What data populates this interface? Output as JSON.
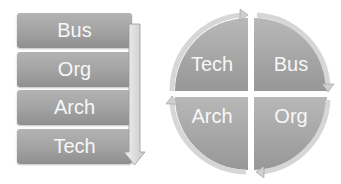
{
  "left_diagram": {
    "type": "vertical-process-stack",
    "items": [
      {
        "label": "Bus"
      },
      {
        "label": "Org"
      },
      {
        "label": "Arch"
      },
      {
        "label": "Tech"
      }
    ],
    "arrow_direction": "down"
  },
  "right_diagram": {
    "type": "cycle-quadrants",
    "quadrants": [
      {
        "position": "top-left",
        "label": "Tech"
      },
      {
        "position": "top-right",
        "label": "Bus"
      },
      {
        "position": "bottom-left",
        "label": "Arch"
      },
      {
        "position": "bottom-right",
        "label": "Org"
      }
    ],
    "cycle_direction": "clockwise"
  },
  "colors": {
    "box_fill": "#a5a5a5",
    "arrow_fill": "#dcdcdc",
    "text": "#f7f7f7"
  }
}
